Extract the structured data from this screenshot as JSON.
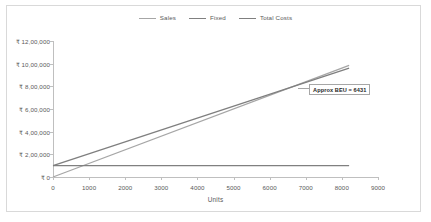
{
  "chart_data": {
    "type": "line",
    "title": "",
    "xlabel": "Units",
    "ylabel": "",
    "xlim": [
      0,
      9000
    ],
    "ylim": [
      0,
      1200000
    ],
    "grid": false,
    "legend_position": "top-center",
    "x_ticks": [
      "0",
      "1000",
      "2000",
      "3000",
      "4000",
      "5000",
      "6000",
      "7000",
      "8000",
      "9000"
    ],
    "x_tick_values": [
      0,
      1000,
      2000,
      3000,
      4000,
      5000,
      6000,
      7000,
      8000,
      9000
    ],
    "y_ticks": [
      "₹ 0",
      "₹ 2,00,000",
      "₹ 4,00,000",
      "₹ 6,00,000",
      "₹ 8,00,000",
      "₹ 10,00,000",
      "₹ 12,00,000"
    ],
    "y_tick_values": [
      0,
      200000,
      400000,
      600000,
      800000,
      1000000,
      1200000
    ],
    "x": [
      0,
      8200
    ],
    "series": [
      {
        "name": "Sales",
        "color": "#a6a6a6",
        "values": [
          0,
          985000
        ]
      },
      {
        "name": "Fixed",
        "color": "#808080",
        "values": [
          100000,
          100000
        ]
      },
      {
        "name": "Total Costs",
        "color": "#7f7f7f",
        "values": [
          100000,
          960000
        ]
      }
    ],
    "annotations": [
      {
        "text": "Approx BEU = 6431",
        "x": 6431,
        "y": 780000
      }
    ]
  },
  "legend": {
    "items": [
      {
        "label": "Sales",
        "color": "#a6a6a6"
      },
      {
        "label": "Fixed",
        "color": "#808080"
      },
      {
        "label": "Total Costs",
        "color": "#7f7f7f"
      }
    ]
  },
  "axis": {
    "x_title": "Units"
  }
}
